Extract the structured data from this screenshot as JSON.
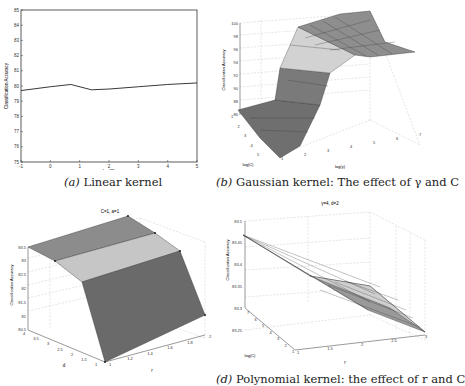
{
  "chart_data": [
    {
      "id": "a",
      "type": "line",
      "caption_label": "(a)",
      "caption": "Linear kernel",
      "title": "",
      "xlabel": "log(C)",
      "ylabel": "Classification Accuracy",
      "xlim": [
        -1,
        5
      ],
      "ylim": [
        75,
        85
      ],
      "xticks": [
        "-1",
        "0",
        "1",
        "2",
        "3",
        "4",
        "5"
      ],
      "yticks": [
        "75",
        "76",
        "77",
        "78",
        "79",
        "80",
        "81",
        "82",
        "83",
        "84",
        "85"
      ],
      "x": [
        -1,
        0,
        0.7,
        1.4,
        2,
        3,
        4,
        5
      ],
      "values": [
        79.7,
        79.95,
        80.1,
        79.75,
        79.8,
        79.95,
        80.1,
        80.2
      ],
      "grid": false
    },
    {
      "id": "b",
      "type": "surface3d",
      "caption_label": "(b)",
      "caption": "Gaussian kernel: The effect of γ and C",
      "title": "",
      "xlabel": "log(γ)",
      "ylabel": "log(C)",
      "zlabel": "Classification Accuracy",
      "xticks": [
        "1",
        "2",
        "3",
        "4",
        "5",
        "6",
        "7"
      ],
      "yticks": [
        "1",
        "2",
        "3",
        "4",
        "5"
      ],
      "zticks": [
        "86",
        "88",
        "90",
        "92",
        "94",
        "96",
        "98",
        "100"
      ],
      "zlim": [
        86,
        100
      ],
      "description": "Accuracy rises from ~86-88 at low log(γ) to ~99-100 at high log(γ), roughly independent of log(C)",
      "grid": true
    },
    {
      "id": "c",
      "type": "surface3d",
      "caption_label": "",
      "caption": "",
      "title": "C=1, a=1",
      "xlabel": "r",
      "ylabel": "d",
      "zlabel": "Classification Accuracy",
      "xticks": [
        "1",
        "1.2",
        "1.4",
        "1.6",
        "1.8",
        "2"
      ],
      "yticks": [
        "1",
        "1.5",
        "2",
        "2.5",
        "3",
        "3.5",
        "4"
      ],
      "zticks": [
        "80.5",
        "81",
        "81.5",
        "82",
        "82.5",
        "83",
        "83.5"
      ],
      "zlim": [
        80.5,
        83.5
      ],
      "grid": true
    },
    {
      "id": "d",
      "type": "surface3d",
      "caption_label": "(d)",
      "caption": "Polynomial kernel: the effect of r and C",
      "title": "γ=4, d=2",
      "xlabel": "r",
      "ylabel": "log(C)",
      "zlabel": "Classification Accuracy",
      "xticks": [
        "1",
        "1.5",
        "2",
        "2.5",
        "3"
      ],
      "yticks": [
        "1",
        "2",
        "3",
        "4",
        "5",
        "6",
        "7"
      ],
      "zticks": [
        "83.25",
        "83.3",
        "83.35",
        "83.4",
        "83.45",
        "83.5"
      ],
      "zlim": [
        83.25,
        83.5
      ],
      "grid": true
    }
  ],
  "captions": {
    "a_label": "(a)",
    "a_text": "Linear kernel",
    "b_label": "(b)",
    "b_text": "Gaussian kernel: The effect of γ and C",
    "d_label": "(d)",
    "d_text": "Polynomial kernel: the effect of r and C"
  },
  "labels": {
    "acc": "Classification Accuracy",
    "logC": "log(C)",
    "loggamma": "log(γ)",
    "c_title": "C=1, a=1",
    "d_title": "γ=4, d=2",
    "r": "r",
    "d": "d"
  },
  "colors": {
    "surface_dark": "#6b6b6b",
    "surface_mid": "#8c8c8c",
    "surface_light": "#cfcfcf",
    "line": "#222222",
    "grid": "#bbbbbb"
  }
}
